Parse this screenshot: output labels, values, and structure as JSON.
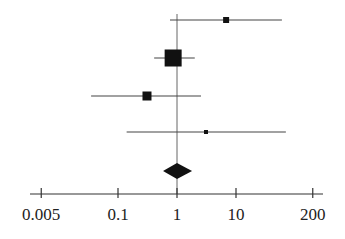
{
  "chart_data": {
    "type": "forest",
    "title": "",
    "xlabel": "",
    "ylabel": "",
    "x_scale": "log",
    "xlim": [
      0.005,
      200
    ],
    "x_ticks": [
      0.005,
      0.1,
      1,
      10,
      200
    ],
    "x_tick_labels": [
      "0.005",
      "0.1",
      "1",
      "10",
      "200"
    ],
    "reference_line": 1,
    "grid": false,
    "legend": null,
    "studies": [
      {
        "estimate": 6.8,
        "ci_low": 0.76,
        "ci_high": 60,
        "weight_marker_px": 6
      },
      {
        "estimate": 0.86,
        "ci_low": 0.41,
        "ci_high": 2.0,
        "weight_marker_px": 17
      },
      {
        "estimate": 0.31,
        "ci_low": 0.035,
        "ci_high": 2.55,
        "weight_marker_px": 9
      },
      {
        "estimate": 3.1,
        "ci_low": 0.14,
        "ci_high": 70,
        "weight_marker_px": 4
      }
    ],
    "pooled": {
      "estimate": 1.0,
      "ci_low": 0.58,
      "ci_high": 1.8
    },
    "colors": {
      "marker": "#111111",
      "line": "#444444",
      "axis": "#333333"
    }
  }
}
